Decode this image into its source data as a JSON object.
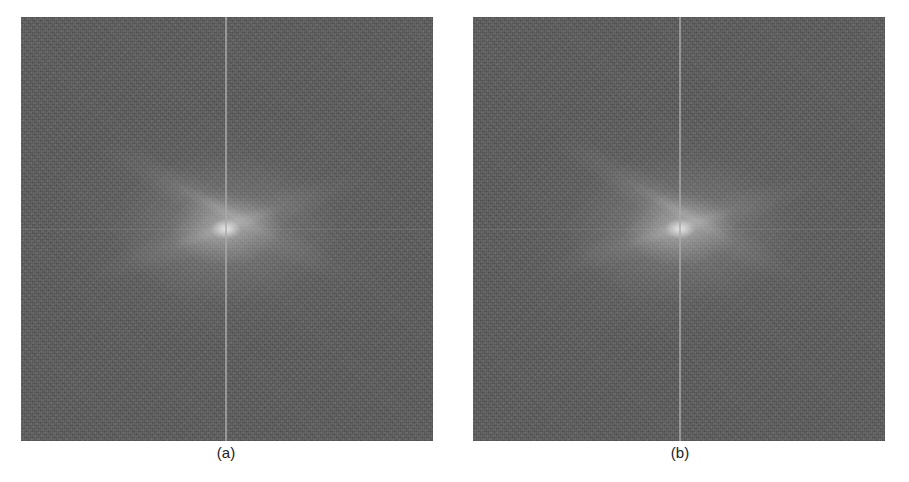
{
  "figure": {
    "panels": [
      {
        "id": "a",
        "caption": "(a)",
        "content": "2D Fourier magnitude spectrum (log-scaled, centered)"
      },
      {
        "id": "b",
        "caption": "(b)",
        "content": "2D Fourier magnitude spectrum (log-scaled, centered)"
      }
    ],
    "colors": {
      "spectrum_background": "#5e5e5e",
      "center_peak": "#ebebeb",
      "axis_line": "#aaaaaa",
      "page_background": "#ffffff"
    }
  }
}
